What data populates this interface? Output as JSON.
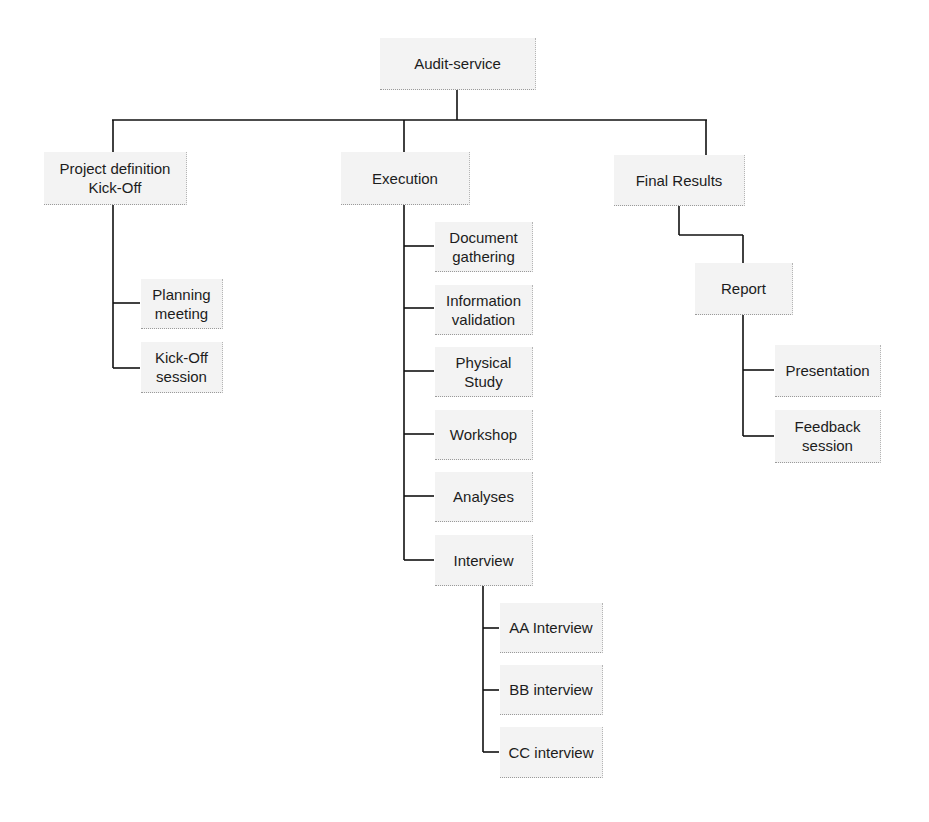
{
  "diagram": {
    "title": "Audit-service",
    "nodes": [
      {
        "id": "audit-service",
        "label": "Audit-service",
        "x": 380,
        "y": 38,
        "w": 156,
        "h": 52
      },
      {
        "id": "project-definition",
        "label": "Project definition\nKick-Off",
        "x": 44,
        "y": 152,
        "w": 143,
        "h": 53
      },
      {
        "id": "execution",
        "label": "Execution",
        "x": 341,
        "y": 152,
        "w": 129,
        "h": 53
      },
      {
        "id": "final-results",
        "label": "Final Results",
        "x": 614,
        "y": 155,
        "w": 131,
        "h": 51
      },
      {
        "id": "planning-meeting",
        "label": "Planning\nmeeting",
        "x": 141,
        "y": 279,
        "w": 82,
        "h": 50
      },
      {
        "id": "kick-off-session",
        "label": "Kick-Off\nsession",
        "x": 141,
        "y": 342,
        "w": 82,
        "h": 51
      },
      {
        "id": "document-gathering",
        "label": "Document\ngathering",
        "x": 435,
        "y": 222,
        "w": 98,
        "h": 50
      },
      {
        "id": "information-validation",
        "label": "Information\nvalidation",
        "x": 435,
        "y": 285,
        "w": 98,
        "h": 50
      },
      {
        "id": "physical-study",
        "label": "Physical\nStudy",
        "x": 435,
        "y": 347,
        "w": 98,
        "h": 50
      },
      {
        "id": "workshop",
        "label": "Workshop",
        "x": 435,
        "y": 410,
        "w": 98,
        "h": 50
      },
      {
        "id": "analyses",
        "label": "Analyses",
        "x": 435,
        "y": 472,
        "w": 98,
        "h": 50
      },
      {
        "id": "interview",
        "label": "Interview",
        "x": 435,
        "y": 535,
        "w": 98,
        "h": 51
      },
      {
        "id": "aa-interview",
        "label": "AA Interview",
        "x": 500,
        "y": 603,
        "w": 103,
        "h": 50
      },
      {
        "id": "bb-interview",
        "label": "BB interview",
        "x": 500,
        "y": 665,
        "w": 103,
        "h": 50
      },
      {
        "id": "cc-interview",
        "label": "CC interview",
        "x": 500,
        "y": 727,
        "w": 103,
        "h": 51
      },
      {
        "id": "report",
        "label": "Report",
        "x": 695,
        "y": 263,
        "w": 98,
        "h": 52
      },
      {
        "id": "presentation",
        "label": "Presentation",
        "x": 775,
        "y": 345,
        "w": 106,
        "h": 52
      },
      {
        "id": "feedback-session",
        "label": "Feedback\nsession",
        "x": 775,
        "y": 410,
        "w": 106,
        "h": 53
      }
    ],
    "edges": [
      {
        "x1": 457,
        "y1": 90,
        "x2": 457,
        "y2": 120
      },
      {
        "x1": 112,
        "y1": 120,
        "x2": 707,
        "y2": 120
      },
      {
        "x1": 113,
        "y1": 120,
        "x2": 113,
        "y2": 152
      },
      {
        "x1": 404,
        "y1": 120,
        "x2": 404,
        "y2": 152
      },
      {
        "x1": 706,
        "y1": 120,
        "x2": 706,
        "y2": 155
      },
      {
        "x1": 113,
        "y1": 205,
        "x2": 113,
        "y2": 368
      },
      {
        "x1": 113,
        "y1": 303,
        "x2": 140,
        "y2": 303
      },
      {
        "x1": 113,
        "y1": 368,
        "x2": 140,
        "y2": 368
      },
      {
        "x1": 404,
        "y1": 205,
        "x2": 404,
        "y2": 560
      },
      {
        "x1": 404,
        "y1": 246,
        "x2": 434,
        "y2": 246
      },
      {
        "x1": 404,
        "y1": 308,
        "x2": 434,
        "y2": 308
      },
      {
        "x1": 404,
        "y1": 371,
        "x2": 434,
        "y2": 371
      },
      {
        "x1": 404,
        "y1": 434,
        "x2": 434,
        "y2": 434
      },
      {
        "x1": 404,
        "y1": 496,
        "x2": 434,
        "y2": 496
      },
      {
        "x1": 404,
        "y1": 560,
        "x2": 434,
        "y2": 560
      },
      {
        "x1": 483,
        "y1": 586,
        "x2": 483,
        "y2": 752
      },
      {
        "x1": 483,
        "y1": 628,
        "x2": 499,
        "y2": 628
      },
      {
        "x1": 483,
        "y1": 690,
        "x2": 499,
        "y2": 690
      },
      {
        "x1": 483,
        "y1": 752,
        "x2": 499,
        "y2": 752
      },
      {
        "x1": 679,
        "y1": 206,
        "x2": 679,
        "y2": 235
      },
      {
        "x1": 679,
        "y1": 235,
        "x2": 743,
        "y2": 235
      },
      {
        "x1": 743,
        "y1": 235,
        "x2": 743,
        "y2": 263
      },
      {
        "x1": 743,
        "y1": 315,
        "x2": 743,
        "y2": 436
      },
      {
        "x1": 743,
        "y1": 370,
        "x2": 774,
        "y2": 370
      },
      {
        "x1": 743,
        "y1": 436,
        "x2": 774,
        "y2": 436
      }
    ]
  }
}
